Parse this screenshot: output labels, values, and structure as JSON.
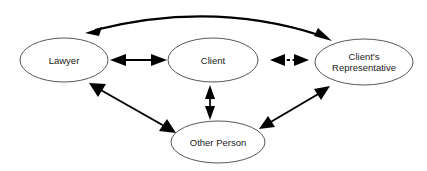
{
  "diagram": {
    "background_color": "#ffffff",
    "node_stroke_color": "#585858",
    "edge_color": "#000000",
    "text_color": "#1a1a1a",
    "nodes": [
      {
        "id": "lawyer",
        "label": "Lawyer",
        "label_lines": [
          "Lawyer"
        ],
        "cx": 64,
        "cy": 60,
        "rx": 44,
        "ry": 22
      },
      {
        "id": "client",
        "label": "Client",
        "label_lines": [
          "Client"
        ],
        "cx": 213,
        "cy": 60,
        "rx": 45,
        "ry": 22
      },
      {
        "id": "client-representative",
        "label": "Client's Representative",
        "label_lines": [
          "Client's",
          "Representative"
        ],
        "cx": 364,
        "cy": 62,
        "rx": 49,
        "ry": 23
      },
      {
        "id": "other-person",
        "label": "Other Person",
        "label_lines": [
          "Other Person"
        ],
        "cx": 218,
        "cy": 142,
        "rx": 47,
        "ry": 21
      }
    ],
    "edges": [
      {
        "id": "lawyer-client",
        "from": "lawyer",
        "to": "client",
        "style": "solid",
        "arrows": "both"
      },
      {
        "id": "client-client-representative",
        "from": "client",
        "to": "client-representative",
        "style": "dashed",
        "arrows": "both"
      },
      {
        "id": "lawyer-client-representative",
        "from": "lawyer",
        "to": "client-representative",
        "style": "curved-arc",
        "arrows": "both"
      },
      {
        "id": "lawyer-other-person",
        "from": "lawyer",
        "to": "other-person",
        "style": "solid",
        "arrows": "both"
      },
      {
        "id": "client-other-person",
        "from": "client",
        "to": "other-person",
        "style": "solid",
        "arrows": "both"
      },
      {
        "id": "client-representative-other-person",
        "from": "client-representative",
        "to": "other-person",
        "style": "solid",
        "arrows": "both"
      }
    ]
  }
}
